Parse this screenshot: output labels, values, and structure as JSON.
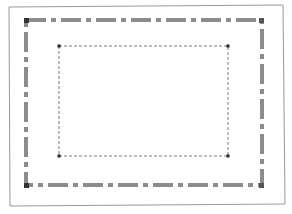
{
  "diagram": {
    "colors": {
      "background": "#ffffff",
      "outer_frame": "#9a9a9a",
      "dash_dot_stroke": "#8c8c8c",
      "corner_marker": "#333333",
      "inner_stroke": "#555555"
    },
    "outer_frame": {
      "x1": 9,
      "y1": 6,
      "x2": 284,
      "y2": 205
    },
    "dash_dot_rect": {
      "x": 26,
      "y": 20,
      "width": 236,
      "height": 165,
      "stroke_width": 4,
      "dasharray": "20 5 5 5"
    },
    "inner_rect": {
      "x": 59,
      "y": 46,
      "width": 169,
      "height": 110,
      "stroke_width": 0.8,
      "dasharray": "3 2"
    },
    "corner_markers": [
      {
        "name": "outer-top-left",
        "x": 26,
        "y": 20
      },
      {
        "name": "outer-top-right",
        "x": 262,
        "y": 20
      },
      {
        "name": "outer-bottom-left",
        "x": 26,
        "y": 185
      },
      {
        "name": "outer-bottom-right",
        "x": 262,
        "y": 185
      },
      {
        "name": "inner-top-left",
        "x": 59,
        "y": 46
      },
      {
        "name": "inner-top-right",
        "x": 228,
        "y": 46
      },
      {
        "name": "inner-bottom-left",
        "x": 59,
        "y": 156
      },
      {
        "name": "inner-bottom-right",
        "x": 228,
        "y": 156
      }
    ]
  }
}
